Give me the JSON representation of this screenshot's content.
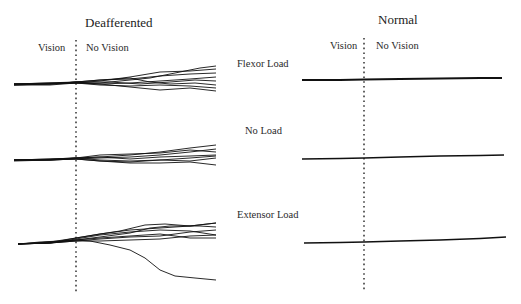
{
  "panels": {
    "left": {
      "title": "Deafferented",
      "vision_label": "Vision",
      "no_vision_label": "No Vision"
    },
    "right": {
      "title": "Normal",
      "vision_label": "Vision",
      "no_vision_label": "No Vision"
    }
  },
  "conditions": [
    {
      "label": "Flexor Load"
    },
    {
      "label": "No Load"
    },
    {
      "label": "Extensor Load"
    }
  ],
  "colors": {
    "trace": "#111111",
    "divider": "#222222"
  },
  "traces": {
    "deafferented": {
      "flexor": [
        "M14,84 L40,84 L60,83 L76,82 L100,80 L130,79 L160,76 L190,74 L216,73",
        "M14,85 L40,84 L76,83 L100,83 L130,80 L150,78 L175,73 L200,68 L216,66",
        "M14,84 L50,84 L76,82 L100,84 L130,83 L160,81 L190,79 L216,77",
        "M14,85 L50,85 L76,83 L100,85 L130,86 L160,85 L190,86 L216,88",
        "M14,84 L45,83 L76,82 L110,82 L140,84 L170,82 L195,80 L216,81",
        "M14,84 L50,83 L76,83 L100,81 L130,77 L160,72 L190,71 L216,69",
        "M14,85 L50,84 L76,83 L100,84 L130,87 L160,90 L190,88 L216,91",
        "M14,84 L50,84 L76,82 L100,80 L130,78 L150,82 L170,84 L195,83 L216,85"
      ],
      "noload": [
        "M14,160 L40,160 L60,159 L76,158 L100,157 L130,155 L160,152 L190,148 L216,145",
        "M14,160 L50,160 L76,159 L100,158 L130,157 L160,155 L190,152 L216,149",
        "M14,160 L50,159 L76,158 L100,160 L130,161 L160,160 L190,158 L216,156",
        "M14,160 L50,160 L76,159 L100,161 L130,163 L160,163 L190,162 L216,165",
        "M14,160 L50,159 L76,158 L100,157 L130,159 L160,157 L190,156 L216,155",
        "M14,160 L50,160 L76,158 L100,155 L130,154 L160,153 L190,150 L216,152",
        "M14,161 L50,160 L76,159 L100,161 L130,162 L160,160 L190,161 L216,158"
      ],
      "extensor": [
        "M18,244 L40,242 L60,241 L76,238 L100,234 L130,230 L160,228 L190,226 L216,223",
        "M18,244 L45,243 L76,240 L100,237 L130,233 L150,228 L170,226 L200,226 L216,227",
        "M18,244 L50,243 L76,241 L100,239 L130,237 L160,236 L190,232 L216,230",
        "M18,244 L50,243 L76,241 L100,241 L130,240 L160,239 L190,236 L216,235",
        "M18,244 L50,242 L76,240 L100,238 L130,236 L160,234 L190,238 L216,238",
        "M18,244 L50,243 L76,240 L90,241 L110,245 L130,250 L145,258 L160,270 L175,276 L195,278 L216,280",
        "M18,244 L50,243 L76,239 L100,235 L130,232 L160,230 L190,231 L216,235",
        "M18,244 L50,242 L76,238 L100,234 L120,231 L145,225 L165,224 L190,226 L216,223"
      ]
    },
    "normal": {
      "flexor": "M302,80 L340,80 L364,79.5 L400,79 L440,78.5 L480,78 L502,78",
      "noload": "M302,159 L340,158.5 L364,158 L400,157 L440,156 L480,155.5 L504,155",
      "extensor": "M304,243 L340,242.5 L364,242 L400,241 L440,240 L480,238.5 L506,237"
    }
  }
}
